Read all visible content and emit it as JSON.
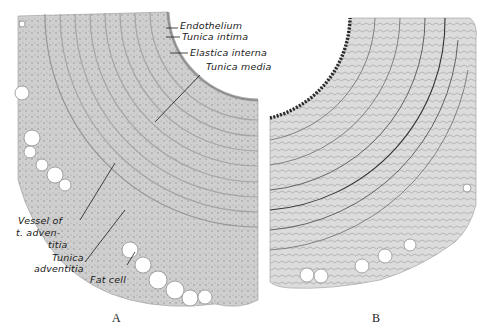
{
  "figure": {
    "panels": [
      {
        "id": "A",
        "letter": "A",
        "description": "Cross-section of artery wall, standard stain"
      },
      {
        "id": "B",
        "letter": "B",
        "description": "Cross-section of artery wall, elastic tissue stain"
      }
    ],
    "labels": {
      "endothelium": "Endothelium",
      "tunica_intima": "Tunica intima",
      "elastica_interna": "Elastica interna",
      "tunica_media": "Tunica media",
      "vessel_line1": "Vessel of",
      "vessel_line2": "t. adven-",
      "vessel_line3": "titia",
      "adventitia_line1": "Tunica",
      "adventitia_line2": "adventitia",
      "fat_cell": "Fat cell"
    },
    "colors": {
      "tissue_fill": "#c9c9c9",
      "tissue_dark": "#7a7a7a",
      "background": "#ffffff",
      "ink": "#1a1a1a"
    }
  }
}
